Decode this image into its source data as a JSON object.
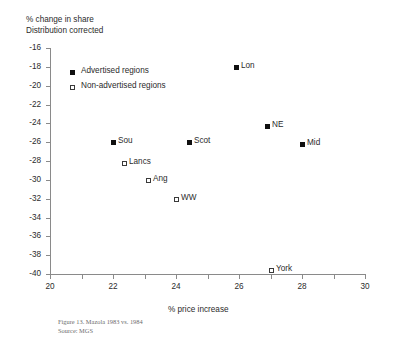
{
  "chart_data": {
    "type": "scatter",
    "title": "",
    "ylabel_line1": "% change in share",
    "ylabel_line2": "Distribution corrected",
    "xlabel": "% price increase",
    "xlim": [
      20,
      30
    ],
    "ylim": [
      -40,
      -16
    ],
    "xticks": [
      20,
      21,
      22,
      23,
      24,
      25,
      26,
      27,
      28,
      29,
      30
    ],
    "xtick_labels": [
      "20",
      "",
      "22",
      "",
      "24",
      "",
      "26",
      "",
      "28",
      "",
      "30"
    ],
    "yticks": [
      -16,
      -18,
      -20,
      -22,
      -24,
      -26,
      -28,
      -30,
      -32,
      -34,
      -36,
      -38,
      -40
    ],
    "ytick_labels": [
      "-16",
      "-18",
      "-20",
      "-22",
      "-24",
      "-26",
      "-28",
      "-30",
      "-32",
      "-34",
      "-36",
      "-38",
      "-40"
    ],
    "grid": false,
    "legend_position": "upper-left-inside",
    "series": [
      {
        "name": "Advertised regions",
        "marker": "filled-square",
        "color": "#101010",
        "points": [
          {
            "label": "Lon",
            "x": 25.9,
            "y": -18.0
          },
          {
            "label": "NE",
            "x": 26.9,
            "y": -24.3
          },
          {
            "label": "Mid",
            "x": 28.0,
            "y": -26.2
          },
          {
            "label": "Scot",
            "x": 24.4,
            "y": -26.0
          },
          {
            "label": "Sou",
            "x": 22.0,
            "y": -26.0
          }
        ]
      },
      {
        "name": "Non-advertised regions",
        "marker": "hollow-square",
        "color": "#ffffff",
        "points": [
          {
            "label": "Lancs",
            "x": 22.35,
            "y": -28.2
          },
          {
            "label": "Ang",
            "x": 23.1,
            "y": -30.0
          },
          {
            "label": "WW",
            "x": 24.0,
            "y": -32.0
          },
          {
            "label": "York",
            "x": 27.0,
            "y": -39.6
          }
        ]
      }
    ]
  },
  "legend": {
    "items": [
      {
        "label": "Advertised regions",
        "marker": "filled-square"
      },
      {
        "label": "Non-advertised regions",
        "marker": "hollow-square"
      }
    ]
  },
  "caption": {
    "figure_line": "Figure 13. Mazola 1983 vs. 1984",
    "source_line": "Source: MGS"
  }
}
